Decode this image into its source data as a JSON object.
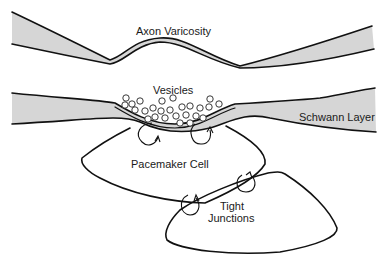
{
  "diagram": {
    "labels": {
      "axon_varicosity": "Axon Varicosity",
      "vesicles": "Vesicles",
      "schwann_layer": "Schwann Layer",
      "pacemaker_cell": "Pacemaker Cell",
      "tight_junctions_line1": "Tight",
      "tight_junctions_line2": "Junctions"
    },
    "colors": {
      "stroke": "#111111",
      "shaded_layer": "#d6d6d6",
      "background": "#ffffff"
    }
  }
}
